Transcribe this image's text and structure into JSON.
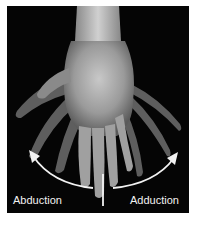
{
  "figure": {
    "labels": {
      "left": "Abduction",
      "right": "Adduction"
    },
    "colors": {
      "background": "#050505",
      "arrows": "#f2f2f2",
      "skin": "#9a9a9a"
    }
  }
}
